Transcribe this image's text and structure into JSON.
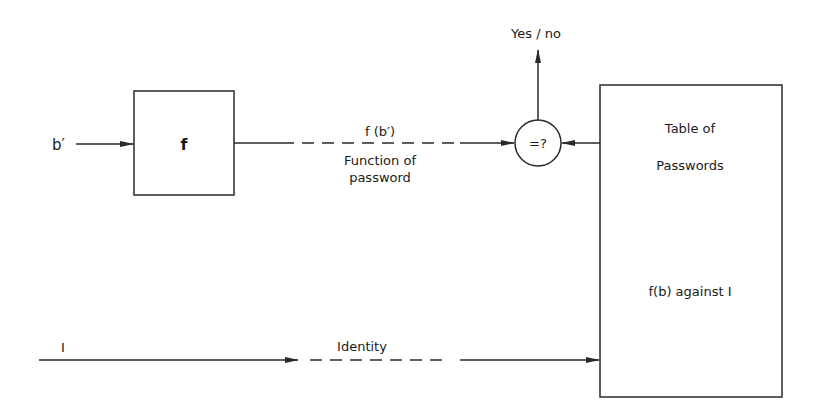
{
  "diagram": {
    "nodes": {
      "input_password": {
        "label": "b′"
      },
      "function_box": {
        "label": "f"
      },
      "comparator": {
        "label": "=?"
      },
      "table": {
        "line1": "Table of",
        "line2": "Passwords",
        "line3": "f(b) against I"
      },
      "input_identity": {
        "label": "I"
      }
    },
    "edges": {
      "fb_label": "f (b′)",
      "fb_desc_line1": "Function of",
      "fb_desc_line2": "password",
      "identity_label": "Identity",
      "output_label": "Yes / no"
    },
    "colors": {
      "stroke": "#2a2a2a",
      "text": "#1a1a1a",
      "background": "#ffffff"
    }
  }
}
